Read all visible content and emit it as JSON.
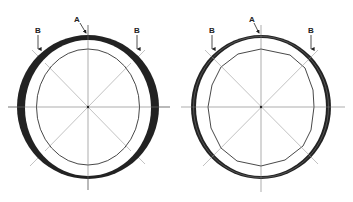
{
  "figure": {
    "panels": [
      {
        "id": "left",
        "labels": {
          "top": "A",
          "left": "B",
          "right": "B"
        },
        "outer_ring": "thick dark ring, thicker at left and right sides",
        "inner_shape": "near-circular oval"
      },
      {
        "id": "right",
        "labels": {
          "top": "A",
          "left": "B",
          "right": "B"
        },
        "outer_ring": "thinner double-line ring, thicker at left and right sides",
        "inner_shape": "slightly polygonal/irregular circle"
      }
    ]
  },
  "colors": {
    "ink": "#222222",
    "guide": "#999999",
    "background": "#ffffff"
  }
}
